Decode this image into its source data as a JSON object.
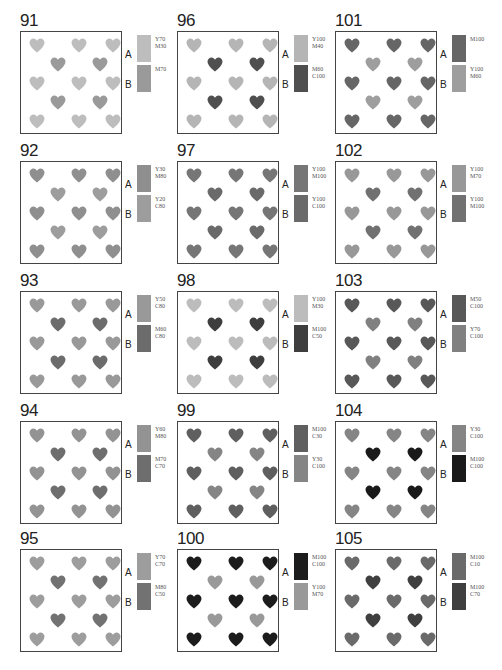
{
  "panels": [
    {
      "number": "91",
      "a_label": "A",
      "b_label": "B",
      "a_cmyk": "Y70\nM30",
      "b_cmyk": "M70",
      "a_color": "#bdbdbd",
      "b_color": "#9a9a9a"
    },
    {
      "number": "92",
      "a_label": "A",
      "b_label": "B",
      "a_cmyk": "Y30\nM80",
      "b_cmyk": "Y20\nC80",
      "a_color": "#8f8f8f",
      "b_color": "#9d9d9d"
    },
    {
      "number": "93",
      "a_label": "A",
      "b_label": "B",
      "a_cmyk": "Y50\nC80",
      "b_cmyk": "M60\nC80",
      "a_color": "#999999",
      "b_color": "#6c6c6c"
    },
    {
      "number": "94",
      "a_label": "A",
      "b_label": "B",
      "a_cmyk": "Y60\nM80",
      "b_cmyk": "M70\nC70",
      "a_color": "#939393",
      "b_color": "#6e6e6e"
    },
    {
      "number": "95",
      "a_label": "A",
      "b_label": "B",
      "a_cmyk": "Y70\nC70",
      "b_cmyk": "M80\nC50",
      "a_color": "#9d9d9d",
      "b_color": "#727272"
    },
    {
      "number": "96",
      "a_label": "A",
      "b_label": "B",
      "a_cmyk": "Y100\nM40",
      "b_cmyk": "M60\nC100",
      "a_color": "#b5b5b5",
      "b_color": "#4f4f4f"
    },
    {
      "number": "97",
      "a_label": "A",
      "b_label": "B",
      "a_cmyk": "Y100\nM100",
      "b_cmyk": "Y100\nC100",
      "a_color": "#767676",
      "b_color": "#6a6a6a"
    },
    {
      "number": "98",
      "a_label": "A",
      "b_label": "B",
      "a_cmyk": "Y100\nM30",
      "b_cmyk": "M100\nC50",
      "a_color": "#bcbcbc",
      "b_color": "#3e3e3e"
    },
    {
      "number": "99",
      "a_label": "A",
      "b_label": "B",
      "a_cmyk": "M100\nC30",
      "b_cmyk": "Y30\nC100",
      "a_color": "#5f5f5f",
      "b_color": "#858585"
    },
    {
      "number": "100",
      "a_label": "A",
      "b_label": "B",
      "a_cmyk": "M100\nC100",
      "b_cmyk": "Y100\nM70",
      "a_color": "#1c1c1c",
      "b_color": "#999999"
    },
    {
      "number": "101",
      "a_label": "A",
      "b_label": "B",
      "a_cmyk": "M100",
      "b_cmyk": "Y100\nM60",
      "a_color": "#666666",
      "b_color": "#9e9e9e"
    },
    {
      "number": "102",
      "a_label": "A",
      "b_label": "B",
      "a_cmyk": "Y100\nM70",
      "b_cmyk": "Y100\nM100",
      "a_color": "#989898",
      "b_color": "#717171"
    },
    {
      "number": "103",
      "a_label": "A",
      "b_label": "B",
      "a_cmyk": "M50\nC100",
      "b_cmyk": "Y70\nC100",
      "a_color": "#585858",
      "b_color": "#808080"
    },
    {
      "number": "104",
      "a_label": "A",
      "b_label": "B",
      "a_cmyk": "Y30\nC100",
      "b_cmyk": "M100\nC100",
      "a_color": "#858585",
      "b_color": "#1a1a1a"
    },
    {
      "number": "105",
      "a_label": "A",
      "b_label": "B",
      "a_cmyk": "M100\nC10",
      "b_cmyk": "M100\nC70",
      "a_color": "#6a6a6a",
      "b_color": "#3f3f3f"
    }
  ],
  "layout": {
    "columns": 3,
    "rows": 5,
    "pattern": "9 A-hearts on a 3x3 outer grid + 4 B-hearts on offset inner 2x2 grid"
  }
}
